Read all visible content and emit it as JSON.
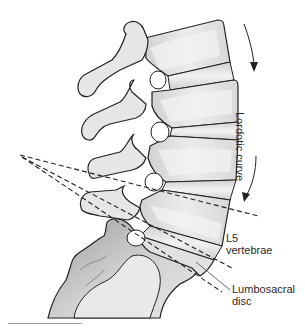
{
  "figure": {
    "labels": {
      "curve": "Lordotic curve",
      "l5_line1": "L5",
      "l5_line2": "vertebrae",
      "disc_line1": "Lumbosacral",
      "disc_line2": "disc"
    },
    "colors": {
      "bone_fill": "#e4e4e4",
      "bone_highlight": "#f6f6f6",
      "bone_shadow": "#bdbdbd",
      "outline": "#222222",
      "dashed_line": "#222222",
      "text": "#2a2a2a",
      "background": "#ffffff"
    }
  }
}
